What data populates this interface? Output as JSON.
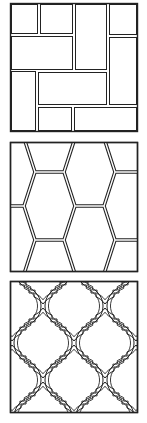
{
  "figure": {
    "tiles": [
      {
        "id": "brick-basketweave",
        "label": "Rectangular brick / pinwheel tile pattern"
      },
      {
        "id": "elongated-hexagon",
        "label": "Elongated hexagon tile pattern"
      },
      {
        "id": "arabesque-lantern",
        "label": "Arabesque lantern tile pattern"
      }
    ]
  },
  "colors": {
    "line": "#222222",
    "background": "#ffffff"
  }
}
